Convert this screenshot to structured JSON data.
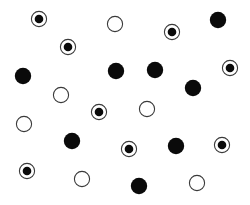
{
  "canvas": {
    "width": 250,
    "height": 205,
    "background": "#ffffff"
  },
  "colors": {
    "ink": "#0a0a0a",
    "ring": "#3a3a3a"
  },
  "legend_types": [
    "filled",
    "open",
    "target"
  ],
  "circles": [
    {
      "type": "target",
      "x": 39,
      "y": 19
    },
    {
      "type": "open",
      "x": 115,
      "y": 24
    },
    {
      "type": "target",
      "x": 172,
      "y": 32
    },
    {
      "type": "filled",
      "x": 218,
      "y": 20
    },
    {
      "type": "target",
      "x": 68,
      "y": 47
    },
    {
      "type": "filled",
      "x": 23,
      "y": 76
    },
    {
      "type": "filled",
      "x": 116,
      "y": 71
    },
    {
      "type": "filled",
      "x": 155,
      "y": 70
    },
    {
      "type": "target",
      "x": 230,
      "y": 68
    },
    {
      "type": "open",
      "x": 61,
      "y": 95
    },
    {
      "type": "filled",
      "x": 193,
      "y": 88
    },
    {
      "type": "target",
      "x": 99,
      "y": 112
    },
    {
      "type": "open",
      "x": 147,
      "y": 109
    },
    {
      "type": "open",
      "x": 24,
      "y": 124
    },
    {
      "type": "filled",
      "x": 72,
      "y": 141
    },
    {
      "type": "target",
      "x": 129,
      "y": 149
    },
    {
      "type": "filled",
      "x": 176,
      "y": 146
    },
    {
      "type": "target",
      "x": 222,
      "y": 145
    },
    {
      "type": "target",
      "x": 27,
      "y": 171
    },
    {
      "type": "open",
      "x": 82,
      "y": 179
    },
    {
      "type": "filled",
      "x": 139,
      "y": 186
    },
    {
      "type": "open",
      "x": 197,
      "y": 183
    }
  ]
}
